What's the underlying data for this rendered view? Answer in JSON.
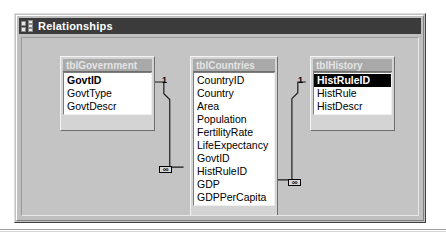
{
  "window": {
    "title": "Relationships",
    "icon": "relationships-icon",
    "background_color": "#c0c0c0",
    "titlebar_color": "#3b3b3b",
    "canvas_color": "#c4c4c4"
  },
  "tables": [
    {
      "name": "tblGovernment",
      "fields": [
        {
          "label": "GovtID",
          "primary_key": true,
          "selected": false
        },
        {
          "label": "GovtType",
          "primary_key": false,
          "selected": false
        },
        {
          "label": "GovtDescr",
          "primary_key": false,
          "selected": false
        }
      ]
    },
    {
      "name": "tblCountries",
      "fields": [
        {
          "label": "CountryID",
          "primary_key": false,
          "selected": false
        },
        {
          "label": "Country",
          "primary_key": false,
          "selected": false
        },
        {
          "label": "Area",
          "primary_key": false,
          "selected": false
        },
        {
          "label": "Population",
          "primary_key": false,
          "selected": false
        },
        {
          "label": "FertilityRate",
          "primary_key": false,
          "selected": false
        },
        {
          "label": "LifeExpectancy",
          "primary_key": false,
          "selected": false
        },
        {
          "label": "GovtID",
          "primary_key": false,
          "selected": false
        },
        {
          "label": "HistRuleID",
          "primary_key": false,
          "selected": false
        },
        {
          "label": "GDP",
          "primary_key": false,
          "selected": false
        },
        {
          "label": "GDPPerCapita",
          "primary_key": false,
          "selected": false
        }
      ]
    },
    {
      "name": "tblHistory",
      "fields": [
        {
          "label": "HistRuleID",
          "primary_key": false,
          "selected": true
        },
        {
          "label": "HistRule",
          "primary_key": false,
          "selected": false
        },
        {
          "label": "HistDescr",
          "primary_key": false,
          "selected": false
        }
      ]
    }
  ],
  "relationships": [
    {
      "id": "govt-to-countries",
      "from_table": "tblGovernment",
      "from_field": "GovtID",
      "to_table": "tblCountries",
      "to_field": "GovtID",
      "one_label": "1",
      "many_label": "∞"
    },
    {
      "id": "history-to-countries",
      "from_table": "tblHistory",
      "from_field": "HistRuleID",
      "to_table": "tblCountries",
      "to_field": "HistRuleID",
      "one_label": "1",
      "many_label": "∞"
    }
  ]
}
